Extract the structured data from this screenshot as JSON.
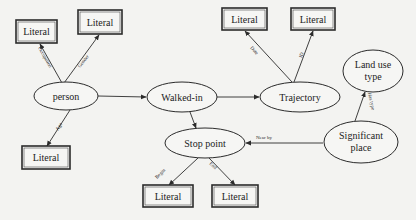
{
  "diagram": {
    "type": "entity-relationship / ontology graph",
    "nodes": {
      "person": {
        "label": "person",
        "shape": "ellipse"
      },
      "walked_in": {
        "label": "Walked-in",
        "shape": "ellipse"
      },
      "trajectory": {
        "label": "Trajectory",
        "shape": "ellipse"
      },
      "stop_point": {
        "label": "Stop point",
        "shape": "ellipse"
      },
      "significant_place": {
        "label_line1": "Significant",
        "label_line2": "place",
        "shape": "ellipse"
      },
      "land_use_type": {
        "label_line1": "Land use",
        "label_line2": "type",
        "shape": "ellipse"
      },
      "literal_occupation": {
        "label": "Literal",
        "shape": "box"
      },
      "literal_gender": {
        "label": "Literal",
        "shape": "box"
      },
      "literal_age": {
        "label": "Literal",
        "shape": "box"
      },
      "literal_date": {
        "label": "Literal",
        "shape": "box"
      },
      "literal_id": {
        "label": "Literal",
        "shape": "box"
      },
      "literal_begin": {
        "label": "Literal",
        "shape": "box"
      },
      "literal_end": {
        "label": "Literal",
        "shape": "box"
      }
    },
    "edges": {
      "occupation": {
        "label": "Occupation",
        "from": "person",
        "to": "literal_occupation"
      },
      "gender": {
        "label": "Gender",
        "from": "person",
        "to": "literal_gender"
      },
      "age": {
        "label": "Age",
        "from": "person",
        "to": "literal_age"
      },
      "person_walked": {
        "label": "",
        "from": "person",
        "to": "walked_in"
      },
      "walked_trajectory": {
        "label": "",
        "from": "walked_in",
        "to": "trajectory"
      },
      "walked_stop": {
        "label": "",
        "from": "walked_in",
        "to": "stop_point"
      },
      "date": {
        "label": "Date",
        "from": "trajectory",
        "to": "literal_date"
      },
      "id": {
        "label": "ID",
        "from": "trajectory",
        "to": "literal_id"
      },
      "near_by": {
        "label": "Near by",
        "from": "significant_place",
        "to": "stop_point"
      },
      "has_type": {
        "label": "Has type",
        "from": "significant_place",
        "to": "land_use_type"
      },
      "begin": {
        "label": "Begin",
        "from": "stop_point",
        "to": "literal_begin"
      },
      "end": {
        "label": "End",
        "from": "stop_point",
        "to": "literal_end"
      }
    }
  },
  "colors": {
    "background": "#f3f3f1",
    "stroke": "#2b2b2b",
    "text": "#1c1c1c"
  }
}
